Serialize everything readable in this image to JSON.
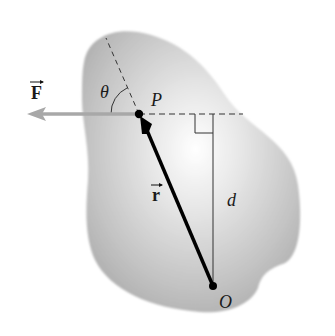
{
  "diagram": {
    "labels": {
      "force": "F",
      "point_p": "P",
      "angle": "θ",
      "position_vector": "r",
      "lever_arm": "d",
      "origin": "O"
    },
    "colors": {
      "body_fill": "#c4c4c4",
      "body_highlight": "#ffffff",
      "force_arrow": "#a8a8a8",
      "position_vector": "#000000",
      "lines": "#333333"
    },
    "points": {
      "P": [
        139,
        114
      ],
      "O": [
        213,
        286
      ]
    }
  }
}
